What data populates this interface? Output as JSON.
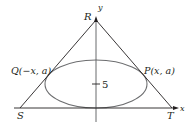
{
  "diagram": {
    "type": "geometry-figure",
    "colors": {
      "lines": "#231f20",
      "ellipse": "#6d6e70",
      "axes": "#58595b",
      "background": "#ffffff"
    },
    "axes": {
      "x_label": "x",
      "y_label": "y"
    },
    "vertices": {
      "R": "R",
      "S": "S",
      "T": "T"
    },
    "points": {
      "P": "P(x, a)",
      "Q": "Q(−x, a)"
    },
    "tick": {
      "value": "5"
    }
  }
}
